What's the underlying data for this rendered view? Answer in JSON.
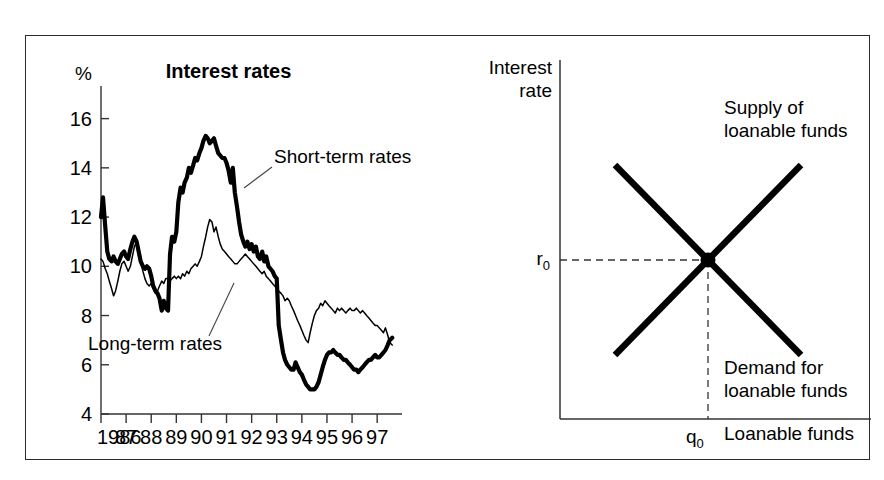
{
  "figure": {
    "frame_color": "#2a2a2a",
    "background": "#ffffff",
    "ink_color": "#000000"
  },
  "left_panel": {
    "title": "Interest rates",
    "y_axis_unit": "%",
    "series_labels": {
      "short_term": "Short-term rates",
      "long_term": "Long-term rates"
    }
  },
  "right_panel": {
    "y_axis_title_line1": "Interest",
    "y_axis_title_line2": "rate",
    "x_axis_title": "Loanable funds",
    "supply_label_line1": "Supply of",
    "supply_label_line2": "loanable funds",
    "demand_label_line1": "Demand for",
    "demand_label_line2": "loanable funds",
    "equilibrium_rate_label": "r",
    "equilibrium_rate_sub": "0",
    "equilibrium_quantity_label": "q",
    "equilibrium_quantity_sub": "0"
  },
  "chart_data": [
    {
      "type": "line",
      "title": "Interest rates",
      "xlabel": "",
      "ylabel": "%",
      "ylim": [
        4,
        17
      ],
      "xlim": [
        1986,
        1997.75
      ],
      "grid": false,
      "legend": "inline-annotations",
      "y_ticks": [
        4,
        6,
        8,
        10,
        12,
        14,
        16
      ],
      "x_tick_labels": [
        "1986",
        "87",
        "88",
        "89",
        "90",
        "91",
        "92",
        "93",
        "94",
        "95",
        "96",
        "97"
      ],
      "x_tick_values": [
        1986,
        1987,
        1988,
        1989,
        1990,
        1991,
        1992,
        1993,
        1994,
        1995,
        1996,
        1997
      ],
      "x_step_per_year": 26,
      "series": [
        {
          "name": "Short-term rates",
          "style": "thick",
          "x": [
            1986.0,
            1986.08,
            1986.17,
            1986.25,
            1986.33,
            1986.42,
            1986.5,
            1986.58,
            1986.67,
            1986.75,
            1986.83,
            1986.92,
            1987.0,
            1987.08,
            1987.17,
            1987.25,
            1987.33,
            1987.42,
            1987.5,
            1987.58,
            1987.67,
            1987.75,
            1987.83,
            1987.92,
            1988.0,
            1988.08,
            1988.17,
            1988.25,
            1988.33,
            1988.42,
            1988.5,
            1988.58,
            1988.67,
            1988.75,
            1988.83,
            1988.92,
            1989.0,
            1989.08,
            1989.17,
            1989.25,
            1989.33,
            1989.42,
            1989.5,
            1989.58,
            1989.67,
            1989.75,
            1989.83,
            1989.92,
            1990.0,
            1990.08,
            1990.17,
            1990.25,
            1990.33,
            1990.42,
            1990.5,
            1990.58,
            1990.67,
            1990.75,
            1990.83,
            1990.92,
            1991.0,
            1991.08,
            1991.17,
            1991.25,
            1991.33,
            1991.42,
            1991.5,
            1991.58,
            1991.67,
            1991.75,
            1991.83,
            1991.92,
            1992.0,
            1992.08,
            1992.17,
            1992.25,
            1992.33,
            1992.42,
            1992.5,
            1992.58,
            1992.67,
            1992.75,
            1992.83,
            1992.92,
            1993.0,
            1993.08,
            1993.17,
            1993.25,
            1993.33,
            1993.42,
            1993.5,
            1993.58,
            1993.67,
            1993.75,
            1993.83,
            1993.92,
            1994.0,
            1994.08,
            1994.17,
            1994.25,
            1994.33,
            1994.42,
            1994.5,
            1994.58,
            1994.67,
            1994.75,
            1994.83,
            1994.92,
            1995.0,
            1995.08,
            1995.17,
            1995.25,
            1995.33,
            1995.42,
            1995.5,
            1995.58,
            1995.67,
            1995.75,
            1995.83,
            1995.92,
            1996.0,
            1996.08,
            1996.17,
            1996.25,
            1996.33,
            1996.42,
            1996.5,
            1996.58,
            1996.67,
            1996.75,
            1996.83,
            1996.92,
            1997.0,
            1997.08,
            1997.17,
            1997.25,
            1997.33,
            1997.42,
            1997.5,
            1997.6
          ],
          "y": [
            12.0,
            12.8,
            11.6,
            10.6,
            10.3,
            10.2,
            10.4,
            10.2,
            10.1,
            10.3,
            10.5,
            10.6,
            10.4,
            10.3,
            10.7,
            11.0,
            11.2,
            11.0,
            10.6,
            10.2,
            10.0,
            9.9,
            10.0,
            9.9,
            9.6,
            9.2,
            9.0,
            8.9,
            8.7,
            8.2,
            8.6,
            8.3,
            8.2,
            10.5,
            11.2,
            11.0,
            11.4,
            12.6,
            13.2,
            13.0,
            13.4,
            13.6,
            14.0,
            13.8,
            14.1,
            14.4,
            14.3,
            14.6,
            14.8,
            15.1,
            15.3,
            15.2,
            15.0,
            15.1,
            15.2,
            14.9,
            14.6,
            14.5,
            14.4,
            14.4,
            14.2,
            13.9,
            13.4,
            14.0,
            13.0,
            12.4,
            11.8,
            11.3,
            11.0,
            10.8,
            11.0,
            10.7,
            10.9,
            10.6,
            10.8,
            10.4,
            10.3,
            10.6,
            10.2,
            10.4,
            10.0,
            9.9,
            9.8,
            9.6,
            9.5,
            7.6,
            7.0,
            6.5,
            6.2,
            6.0,
            5.9,
            5.8,
            5.8,
            6.1,
            5.9,
            5.7,
            5.6,
            5.4,
            5.2,
            5.1,
            5.0,
            5.0,
            5.0,
            5.1,
            5.3,
            5.6,
            5.9,
            6.2,
            6.4,
            6.5,
            6.5,
            6.6,
            6.5,
            6.4,
            6.4,
            6.3,
            6.2,
            6.2,
            6.1,
            6.0,
            5.9,
            5.8,
            5.8,
            5.7,
            5.8,
            5.9,
            6.0,
            6.1,
            6.2,
            6.2,
            6.3,
            6.4,
            6.3,
            6.3,
            6.4,
            6.5,
            6.6,
            6.8,
            7.0,
            7.1
          ]
        },
        {
          "name": "Long-term rates",
          "style": "thin",
          "x": [
            1986.0,
            1986.08,
            1986.17,
            1986.25,
            1986.33,
            1986.42,
            1986.5,
            1986.58,
            1986.67,
            1986.75,
            1986.83,
            1986.92,
            1987.0,
            1987.08,
            1987.17,
            1987.25,
            1987.33,
            1987.42,
            1987.5,
            1987.58,
            1987.67,
            1987.75,
            1987.83,
            1987.92,
            1988.0,
            1988.08,
            1988.17,
            1988.25,
            1988.33,
            1988.42,
            1988.5,
            1988.58,
            1988.67,
            1988.75,
            1988.83,
            1988.92,
            1989.0,
            1989.08,
            1989.17,
            1989.25,
            1989.33,
            1989.42,
            1989.5,
            1989.58,
            1989.67,
            1989.75,
            1989.83,
            1989.92,
            1990.0,
            1990.08,
            1990.17,
            1990.25,
            1990.33,
            1990.42,
            1990.5,
            1990.58,
            1990.67,
            1990.75,
            1990.83,
            1990.92,
            1991.0,
            1991.08,
            1991.17,
            1991.25,
            1991.33,
            1991.42,
            1991.5,
            1991.58,
            1991.67,
            1991.75,
            1991.83,
            1991.92,
            1992.0,
            1992.08,
            1992.17,
            1992.25,
            1992.33,
            1992.42,
            1992.5,
            1992.58,
            1992.67,
            1992.75,
            1992.83,
            1992.92,
            1993.0,
            1993.08,
            1993.17,
            1993.25,
            1993.33,
            1993.42,
            1993.5,
            1993.58,
            1993.67,
            1993.75,
            1993.83,
            1993.92,
            1994.0,
            1994.08,
            1994.17,
            1994.25,
            1994.33,
            1994.42,
            1994.5,
            1994.58,
            1994.67,
            1994.75,
            1994.83,
            1994.92,
            1995.0,
            1995.08,
            1995.17,
            1995.25,
            1995.33,
            1995.42,
            1995.5,
            1995.58,
            1995.67,
            1995.75,
            1995.83,
            1995.92,
            1996.0,
            1996.08,
            1996.17,
            1996.25,
            1996.33,
            1996.42,
            1996.5,
            1996.58,
            1996.67,
            1996.75,
            1996.83,
            1996.92,
            1997.0,
            1997.08,
            1997.17,
            1997.25,
            1997.33,
            1997.42,
            1997.5,
            1997.6
          ],
          "y": [
            10.3,
            10.2,
            9.9,
            9.7,
            9.4,
            9.1,
            8.8,
            9.0,
            9.4,
            9.8,
            10.1,
            10.2,
            10.0,
            9.8,
            10.0,
            10.4,
            10.8,
            11.0,
            10.6,
            10.2,
            9.8,
            9.5,
            9.3,
            9.2,
            9.3,
            9.1,
            8.9,
            9.0,
            9.2,
            9.4,
            9.3,
            9.5,
            9.5,
            9.4,
            9.5,
            9.6,
            9.5,
            9.6,
            9.5,
            9.7,
            9.6,
            9.8,
            9.7,
            9.9,
            10.0,
            10.1,
            10.0,
            10.2,
            10.4,
            10.8,
            11.2,
            11.6,
            11.9,
            11.8,
            11.4,
            11.6,
            11.2,
            10.9,
            10.7,
            10.6,
            10.5,
            10.4,
            10.3,
            10.2,
            10.1,
            10.1,
            10.2,
            10.3,
            10.4,
            10.5,
            10.4,
            10.3,
            10.2,
            10.1,
            10.0,
            9.9,
            9.8,
            9.7,
            9.8,
            9.6,
            9.5,
            9.4,
            9.3,
            9.2,
            9.1,
            9.0,
            8.9,
            8.8,
            8.6,
            8.7,
            8.6,
            8.4,
            8.2,
            8.0,
            7.8,
            7.6,
            7.4,
            7.2,
            7.0,
            6.9,
            7.3,
            7.7,
            8.0,
            8.2,
            8.3,
            8.5,
            8.4,
            8.6,
            8.5,
            8.4,
            8.3,
            8.2,
            8.1,
            8.3,
            8.2,
            8.3,
            8.2,
            8.1,
            8.2,
            8.3,
            8.2,
            8.2,
            8.3,
            8.2,
            8.1,
            8.2,
            8.1,
            8.0,
            7.9,
            7.8,
            7.7,
            7.6,
            7.6,
            7.5,
            7.4,
            7.3,
            7.5,
            7.2,
            6.9,
            6.8
          ]
        }
      ]
    },
    {
      "type": "line",
      "title": "",
      "xlabel": "Loanable funds",
      "ylabel": "Interest rate",
      "grid": false,
      "legend": "inline-annotations",
      "series": [
        {
          "name": "Supply of loanable funds",
          "slope": "upward",
          "points": [
            [
              0.22,
              0.18
            ],
            [
              0.92,
              0.82
            ]
          ]
        },
        {
          "name": "Demand for loanable funds",
          "slope": "downward",
          "points": [
            [
              0.22,
              0.82
            ],
            [
              0.92,
              0.18
            ]
          ]
        }
      ],
      "equilibrium": {
        "x_label": "q0",
        "y_label": "r0",
        "x": 0.57,
        "y": 0.5
      }
    }
  ]
}
